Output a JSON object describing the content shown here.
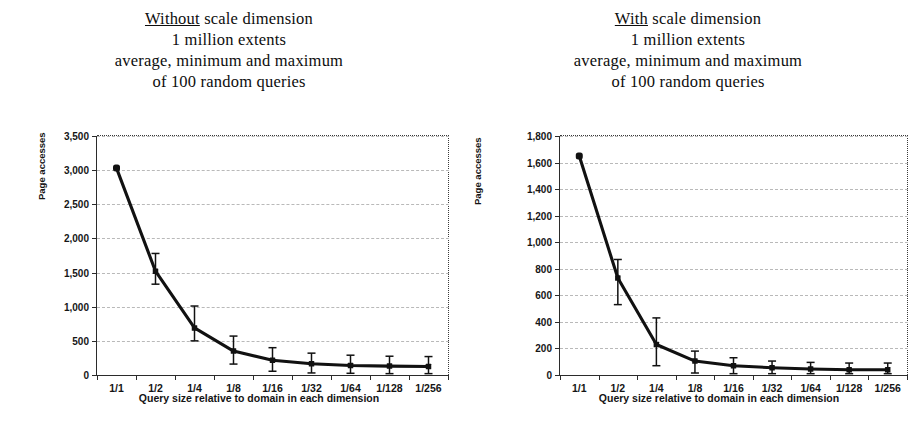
{
  "charts": [
    {
      "id": "without-scale-dimension",
      "title_lines": [
        {
          "underlined": "Without",
          "rest": " scale dimension"
        },
        {
          "underlined": "",
          "rest": "1 million extents"
        },
        {
          "underlined": "",
          "rest": "average, minimum and maximum"
        },
        {
          "underlined": "",
          "rest": "of 100 random queries"
        }
      ],
      "ylabels": [
        "3,500",
        "3,000",
        "2,500",
        "2,000",
        "1,500",
        "1,000",
        "500",
        "0"
      ],
      "xlabels": [
        "1/1",
        "1/2",
        "1/4",
        "1/8",
        "1/16",
        "1/32",
        "1/64",
        "1/128",
        "1/256"
      ],
      "xtitle": "Query size relative to domain in each dimension",
      "ytitle": "Page accesses"
    },
    {
      "id": "with-scale-dimension",
      "title_lines": [
        {
          "underlined": "With",
          "rest": " scale dimension"
        },
        {
          "underlined": "",
          "rest": "1 million extents"
        },
        {
          "underlined": "",
          "rest": "average, minimum and maximum"
        },
        {
          "underlined": "",
          "rest": "of 100 random queries"
        }
      ],
      "ylabels": [
        "1,800",
        "1,600",
        "1,400",
        "1,200",
        "1,000",
        "800",
        "600",
        "400",
        "200",
        "0"
      ],
      "xlabels": [
        "1/1",
        "1/2",
        "1/4",
        "1/8",
        "1/16",
        "1/32",
        "1/64",
        "1/128",
        "1/256"
      ],
      "xtitle": "Query size relative to domain in each dimension",
      "ytitle": "Page accesses"
    }
  ],
  "chart_data": [
    {
      "type": "line",
      "id": "without-scale-dimension",
      "title": "Without scale dimension / 1 million extents / average, minimum and maximum of 100 random queries",
      "xlabel": "Query size relative to domain in each dimension",
      "ylabel": "Page accesses",
      "categories": [
        "1/1",
        "1/2",
        "1/4",
        "1/8",
        "1/16",
        "1/32",
        "1/64",
        "1/128",
        "1/256"
      ],
      "series": [
        {
          "name": "average page accesses",
          "values": [
            3030,
            1520,
            690,
            350,
            215,
            165,
            140,
            130,
            125
          ]
        }
      ],
      "error_bars": {
        "min": [
          3030,
          1330,
          500,
          160,
          55,
          30,
          25,
          20,
          20
        ],
        "max": [
          3030,
          1780,
          1010,
          570,
          400,
          320,
          290,
          275,
          270
        ]
      },
      "ylim": [
        0,
        3500
      ],
      "ytick_step": 500,
      "yticks": [
        0,
        500,
        1000,
        1500,
        2000,
        2500,
        3000,
        3500
      ],
      "grid": true,
      "legend": "none",
      "markers": "filled-square"
    },
    {
      "type": "line",
      "id": "with-scale-dimension",
      "title": "With scale dimension / 1 million extents / average, minimum and maximum of 100 random queries",
      "xlabel": "Query size relative to domain in each dimension",
      "ylabel": "Page accesses",
      "categories": [
        "1/1",
        "1/2",
        "1/4",
        "1/8",
        "1/16",
        "1/32",
        "1/64",
        "1/128",
        "1/256"
      ],
      "series": [
        {
          "name": "average page accesses",
          "values": [
            1650,
            730,
            230,
            105,
            70,
            55,
            45,
            40,
            40
          ]
        }
      ],
      "error_bars": {
        "min": [
          1650,
          530,
          70,
          15,
          10,
          10,
          10,
          10,
          10
        ],
        "max": [
          1650,
          870,
          430,
          180,
          130,
          105,
          95,
          90,
          90
        ]
      },
      "ylim": [
        0,
        1800
      ],
      "ytick_step": 200,
      "yticks": [
        0,
        200,
        400,
        600,
        800,
        1000,
        1200,
        1400,
        1600,
        1800
      ],
      "grid": true,
      "legend": "none",
      "markers": "filled-square"
    }
  ],
  "colors": {
    "series": "#111111",
    "axis": "#2b2b2b",
    "grid": "#b9b9b9",
    "background": "#ffffff"
  }
}
